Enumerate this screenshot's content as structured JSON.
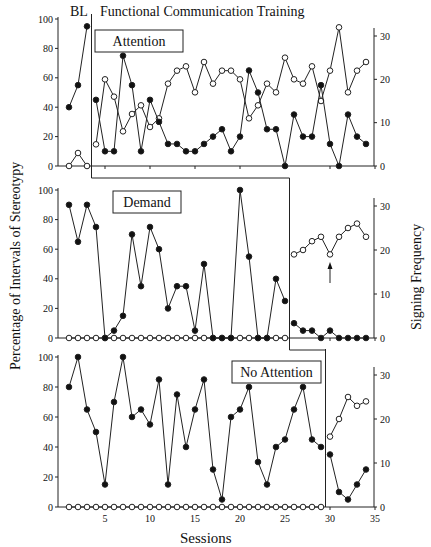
{
  "chart_data": {
    "type": "line",
    "title": "Functional Communication Training",
    "phase_labels": [
      "BL",
      "Functional Communication Training"
    ],
    "xlabel": "Sessions",
    "ylabel_left": "Percentage of Intervals of Stereotypy",
    "ylabel_right": "Signing Frequency",
    "x_ticks": [
      5,
      10,
      15,
      20,
      25,
      30,
      35
    ],
    "x_range": [
      0,
      35
    ],
    "y_left_ticks": [
      0,
      20,
      40,
      60,
      80,
      100
    ],
    "y_left_range": [
      0,
      100
    ],
    "y_right_ticks": [
      0,
      10,
      20,
      30
    ],
    "y_right_range": [
      0,
      33
    ],
    "grid": false,
    "annotations": [
      "Signing",
      "Stereotypy"
    ],
    "panels": [
      {
        "name": "Attention",
        "baseline_end": 3,
        "series": [
          {
            "name": "Stereotypy (%)",
            "marker": "filled",
            "axis": "left",
            "x": [
              1,
              2,
              3,
              4,
              5,
              6,
              7,
              8,
              9,
              10,
              11,
              12,
              13,
              14,
              15,
              16,
              17,
              18,
              19,
              20,
              21,
              22,
              23,
              24,
              25,
              26,
              27,
              28,
              29,
              30,
              31,
              32,
              33,
              34
            ],
            "values": [
              40,
              55,
              95,
              45,
              10,
              10,
              75,
              55,
              10,
              45,
              30,
              15,
              15,
              10,
              10,
              15,
              20,
              25,
              10,
              20,
              65,
              50,
              25,
              25,
              0,
              35,
              20,
              20,
              55,
              15,
              0,
              35,
              20,
              15
            ]
          },
          {
            "name": "Signing (frequency)",
            "marker": "open",
            "axis": "right",
            "x": [
              1,
              2,
              3,
              4,
              5,
              6,
              7,
              8,
              9,
              10,
              11,
              12,
              13,
              14,
              15,
              16,
              17,
              18,
              19,
              20,
              21,
              22,
              23,
              24,
              25,
              26,
              27,
              28,
              29,
              30,
              31,
              32,
              33,
              34
            ],
            "values": [
              0,
              3,
              0,
              5,
              20,
              16,
              8,
              12,
              14,
              9,
              11,
              19,
              22,
              23,
              17,
              24,
              19,
              22,
              22,
              20,
              11,
              14,
              19,
              17,
              25,
              20,
              19,
              23,
              15,
              22,
              32,
              17,
              22,
              24
            ]
          }
        ]
      },
      {
        "name": "Demand",
        "baseline_end": 25,
        "series": [
          {
            "name": "Stereotypy (%)",
            "marker": "filled",
            "axis": "left",
            "x": [
              1,
              2,
              3,
              4,
              5,
              6,
              7,
              8,
              9,
              10,
              11,
              12,
              13,
              14,
              15,
              16,
              17,
              18,
              19,
              20,
              21,
              22,
              23,
              24,
              25,
              26,
              27,
              28,
              29,
              30,
              31,
              32,
              33,
              34
            ],
            "values": [
              90,
              65,
              90,
              75,
              0,
              5,
              15,
              70,
              35,
              75,
              60,
              20,
              35,
              35,
              5,
              50,
              0,
              0,
              0,
              100,
              55,
              0,
              0,
              40,
              25,
              10,
              5,
              5,
              0,
              5,
              0,
              0,
              0,
              0
            ]
          },
          {
            "name": "Signing (frequency)",
            "marker": "open",
            "axis": "right",
            "x": [
              1,
              2,
              3,
              4,
              5,
              6,
              7,
              8,
              9,
              10,
              11,
              12,
              13,
              14,
              15,
              16,
              17,
              18,
              19,
              20,
              21,
              22,
              23,
              24,
              25,
              26,
              27,
              28,
              29,
              30,
              31,
              32,
              33,
              34
            ],
            "values": [
              0,
              0,
              0,
              0,
              0,
              0,
              0,
              0,
              0,
              0,
              0,
              0,
              0,
              0,
              0,
              0,
              0,
              0,
              0,
              0,
              0,
              0,
              0,
              0,
              0,
              19,
              20,
              22,
              23,
              19,
              23,
              25,
              26,
              23
            ]
          }
        ]
      },
      {
        "name": "No Attention",
        "baseline_end": 29,
        "series": [
          {
            "name": "Stereotypy (%)",
            "marker": "filled",
            "axis": "left",
            "x": [
              1,
              2,
              3,
              4,
              5,
              6,
              7,
              8,
              9,
              10,
              11,
              12,
              13,
              14,
              15,
              16,
              17,
              18,
              19,
              20,
              21,
              22,
              23,
              24,
              25,
              26,
              27,
              28,
              29,
              30,
              31,
              32,
              33,
              34
            ],
            "values": [
              80,
              100,
              65,
              50,
              15,
              70,
              100,
              60,
              65,
              55,
              85,
              15,
              75,
              40,
              65,
              85,
              25,
              5,
              60,
              65,
              80,
              30,
              15,
              40,
              45,
              65,
              80,
              45,
              40,
              35,
              10,
              5,
              15,
              25
            ]
          },
          {
            "name": "Signing (frequency)",
            "marker": "open",
            "axis": "right",
            "x": [
              1,
              2,
              3,
              4,
              5,
              6,
              7,
              8,
              9,
              10,
              11,
              12,
              13,
              14,
              15,
              16,
              17,
              18,
              19,
              20,
              21,
              22,
              23,
              24,
              25,
              26,
              27,
              28,
              29,
              30,
              31,
              32,
              33,
              34
            ],
            "values": [
              0,
              0,
              0,
              0,
              0,
              0,
              0,
              0,
              0,
              0,
              0,
              0,
              0,
              0,
              0,
              0,
              0,
              0,
              0,
              0,
              0,
              0,
              0,
              0,
              0,
              0,
              0,
              0,
              0,
              16,
              20,
              25,
              23,
              24
            ]
          }
        ]
      }
    ]
  },
  "labels": {
    "bl": "BL",
    "fct": "Functional Communication Training",
    "xlabel": "Sessions",
    "ylabel_left": "Percentage of Intervals of Stereotypy",
    "ylabel_right": "Signing Frequency",
    "annot_signing": "Signing",
    "annot_stereotypy": "Stereotypy"
  }
}
